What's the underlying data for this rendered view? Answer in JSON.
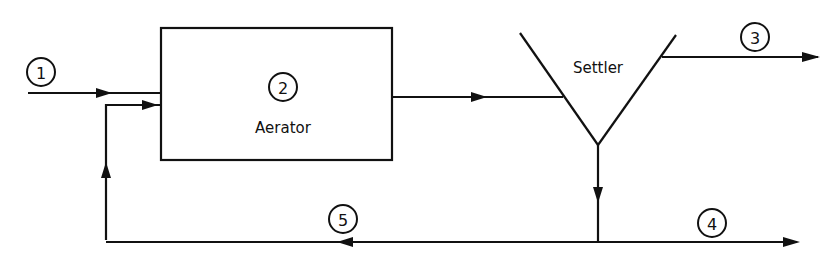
{
  "diagram": {
    "type": "process-flow",
    "units": {
      "aerator": {
        "label": "Aerator",
        "number": "2"
      },
      "settler": {
        "label": "Settler"
      }
    },
    "streams": [
      {
        "id": "1",
        "label": "1",
        "description": "feed into aerator"
      },
      {
        "id": "3",
        "label": "3",
        "description": "settler overflow"
      },
      {
        "id": "4",
        "label": "4",
        "description": "settler underflow out"
      },
      {
        "id": "5",
        "label": "5",
        "description": "recycle to aerator"
      }
    ],
    "colors": {
      "line": "#111111",
      "background": "#ffffff"
    }
  }
}
